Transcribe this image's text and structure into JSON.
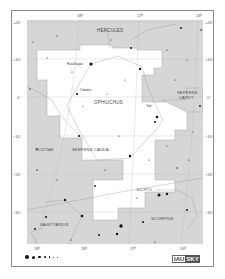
{
  "map": {
    "title": "Ophiuchus",
    "ra_ticks_top": [
      {
        "label": "18ʰ",
        "x": 77
      },
      {
        "label": "17ʰ",
        "x": 137
      },
      {
        "label": "16ʰ",
        "x": 196
      }
    ],
    "ra_ticks_bottom": [
      {
        "label": "18ʰ",
        "x": 34
      },
      {
        "label": "18ʰ",
        "x": 81
      },
      {
        "label": "17ʰ",
        "x": 130
      },
      {
        "label": "16ʰ",
        "x": 180
      }
    ],
    "dec_ticks_left": [
      {
        "label": "+20°",
        "y": 22
      },
      {
        "label": "+10°",
        "y": 59
      },
      {
        "label": "0°",
        "y": 97
      },
      {
        "label": "−10°",
        "y": 136
      },
      {
        "label": "−20°",
        "y": 174
      },
      {
        "label": "−30°",
        "y": 212
      }
    ],
    "dec_ticks_right": [
      {
        "label": "+20°",
        "y": 22
      },
      {
        "label": "+10°",
        "y": 59
      },
      {
        "label": "0°",
        "y": 97
      },
      {
        "label": "−10°",
        "y": 136
      },
      {
        "label": "−20°",
        "y": 174
      },
      {
        "label": "−30°",
        "y": 212
      }
    ],
    "constellations": {
      "hercules": "HERCULES",
      "ophiuchus": "OPHIUCHUS",
      "serpens_caput_1": "SERPENS",
      "serpens_caput_2": "CAPUT",
      "serpens_cauda": "SERPENS CAUDA",
      "scutum": "SCUTUM",
      "sagittarius": "SAGITTARIUS",
      "scorpius": "SCORPIUS",
      "ecliptic": "ECLIPTIC"
    },
    "star_names": {
      "rasalhague": "Rasalhague",
      "cebalrai": "Cebalrai",
      "yed": "Yed",
      "sabik": "Sabik",
      "marfik": "Marfik"
    },
    "legend": {
      "magnitudes": [
        "0",
        "1",
        "2",
        "3",
        "4",
        "5",
        "6"
      ]
    },
    "logo": {
      "iau": "IAU",
      "sky": "SKY"
    },
    "colors": {
      "background": "#ffffff",
      "chart_fill": "#d6d6d6",
      "constellation_fill": "#ffffff",
      "star": "#111111",
      "grid": "#aaaaaa"
    }
  }
}
